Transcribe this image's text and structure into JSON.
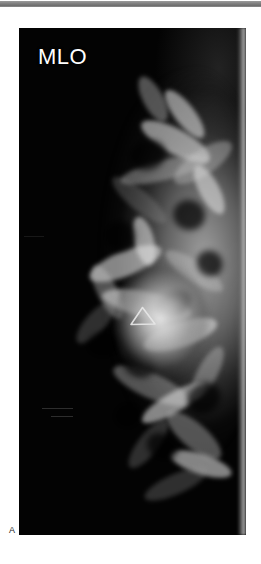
{
  "figure": {
    "panel_letter": "A",
    "rule_color": "#7e7e7e",
    "background_color": "#ffffff"
  },
  "mammogram": {
    "view_label": "MLO",
    "modality": "mammography",
    "laterality_orientation": "chest wall at right, nipple toward left",
    "film_background_color": "#000000",
    "panel": {
      "x": 19,
      "y": 28,
      "width": 227,
      "height": 507
    },
    "annotations": [
      {
        "name": "triangular-marker",
        "shape": "triangle-outline",
        "color": "#e8e8e8",
        "x": 109,
        "y": 277,
        "width": 29,
        "height": 22
      }
    ],
    "findings": {
      "dense_mass_location": "central breast",
      "mass_appearance": "spiculated high-density mass with radiating strands"
    }
  }
}
